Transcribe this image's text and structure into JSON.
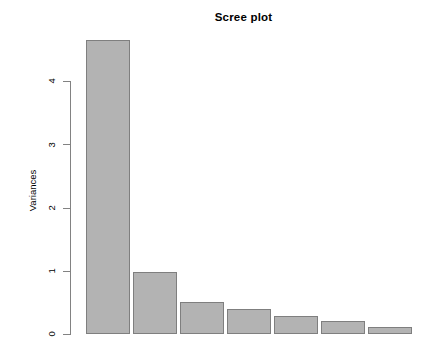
{
  "chart_data": {
    "type": "bar",
    "title": "Scree plot",
    "xlabel": "",
    "ylabel": "Variances",
    "categories": [
      "1",
      "2",
      "3",
      "4",
      "5",
      "6",
      "7"
    ],
    "values": [
      4.65,
      0.98,
      0.5,
      0.39,
      0.29,
      0.21,
      0.11
    ],
    "ylim": [
      0,
      4.8
    ],
    "yticks": [
      0,
      1,
      2,
      3,
      4
    ],
    "ytick_labels": [
      "0",
      "1",
      "2",
      "3",
      "4"
    ],
    "xticks_shown": false,
    "grid": false,
    "legend": "none",
    "bar_fill_color": "#b3b3b3",
    "bar_border_color": "#7f7f7f",
    "axis_color": "#828282",
    "background_color": "#ffffff"
  },
  "layout": {
    "plot_left_px": 86,
    "plot_right_px": 416,
    "baseline_px": 334,
    "top_value_px": 81,
    "px_per_unit": 63.25,
    "bar_width_px": 44,
    "bar_gap_px": 3
  }
}
